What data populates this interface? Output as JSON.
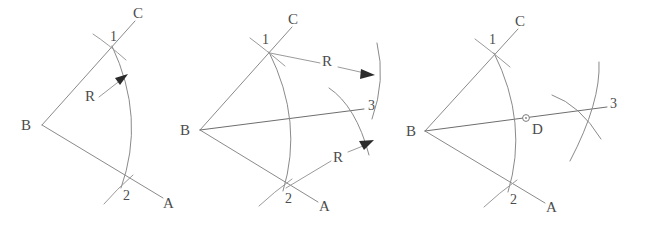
{
  "figure": {
    "width": 647,
    "height": 228,
    "background": "#ffffff",
    "line_color": "#8a8a8a",
    "label_color": "#4c4c4c",
    "arrow_color": "#2b2b2b"
  },
  "panels": [
    {
      "id": "panel-1",
      "step": "1",
      "labels": {
        "vertex": "B",
        "ray_upper": "C",
        "ray_lower": "A",
        "intersection_upper": "1",
        "intersection_lower": "2",
        "radius": "R"
      }
    },
    {
      "id": "panel-2",
      "step": "2",
      "labels": {
        "vertex": "B",
        "ray_upper": "C",
        "ray_lower": "A",
        "intersection_upper": "1",
        "intersection_lower": "2",
        "intersection_right": "3",
        "radius_upper": "R",
        "radius_lower": "R"
      }
    },
    {
      "id": "panel-3",
      "step": "3",
      "labels": {
        "vertex": "B",
        "ray_upper": "C",
        "ray_lower": "A",
        "intersection_upper": "1",
        "intersection_lower": "2",
        "intersection_right": "3",
        "point_on_arc": "D"
      }
    }
  ]
}
